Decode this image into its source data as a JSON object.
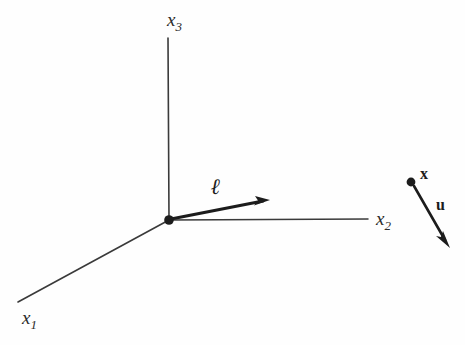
{
  "figure": {
    "type": "diagram",
    "background_color": "#fefefe",
    "line_color": "#3a3a3a",
    "bold_line_color": "#1c1c1c",
    "text_color": "#2b2b2b",
    "width": 465,
    "height": 345
  },
  "origin": {
    "label": "origin-dot",
    "x": 169,
    "y": 220,
    "radius": 4.5
  },
  "axes": [
    {
      "name": "x1",
      "label_base": "x",
      "label_sub": "1",
      "from_x": 169,
      "from_y": 220,
      "to_x": 18,
      "to_y": 302,
      "label_x": 22,
      "label_y": 308
    },
    {
      "name": "x2",
      "label_base": "x",
      "label_sub": "2",
      "from_x": 169,
      "from_y": 220,
      "to_x": 368,
      "to_y": 219,
      "label_x": 376,
      "label_y": 209
    },
    {
      "name": "x3",
      "label_base": "x",
      "label_sub": "3",
      "from_x": 169,
      "from_y": 220,
      "to_x": 168,
      "to_y": 38,
      "label_x": 167,
      "label_y": 10
    }
  ],
  "vectors": [
    {
      "name": "ell",
      "label": "ℓ",
      "from_x": 171,
      "from_y": 219,
      "to_x": 268,
      "to_y": 200,
      "label_x": 211,
      "label_y": 176,
      "stroke_width": 3.2,
      "arrow_size": 11
    },
    {
      "name": "u",
      "label": "u",
      "from_x": 414,
      "from_y": 186,
      "to_x": 449,
      "to_y": 247,
      "label_x": 436,
      "label_y": 197,
      "stroke_width": 2.6,
      "arrow_size": 10
    }
  ],
  "points": [
    {
      "name": "x-point",
      "label": "x",
      "x": 411,
      "y": 182,
      "radius": 4.2,
      "label_x": 420,
      "label_y": 166
    }
  ]
}
